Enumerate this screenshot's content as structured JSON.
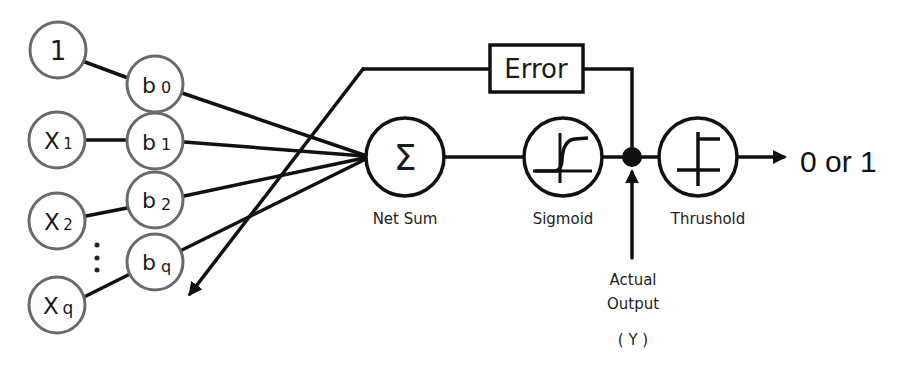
{
  "diagram": {
    "inputs": [
      {
        "label": "1",
        "sub": ""
      },
      {
        "label": "X",
        "sub": "1"
      },
      {
        "label": "X",
        "sub": "2"
      },
      {
        "label": "X",
        "sub": "q"
      }
    ],
    "weights": [
      {
        "label": "b",
        "sub": "0"
      },
      {
        "label": "b",
        "sub": "1"
      },
      {
        "label": "b",
        "sub": "2"
      },
      {
        "label": "b",
        "sub": "q"
      }
    ],
    "ellipsis": "⋮",
    "net_sum": {
      "symbol": "Σ",
      "label": "Net Sum"
    },
    "sigmoid": {
      "label": "Sigmoid"
    },
    "threshold": {
      "label": "Thrushold"
    },
    "error_box": {
      "label": "Error"
    },
    "actual_output": {
      "line1": "Actual",
      "line2": "Output",
      "symbol": "( Y )"
    },
    "output": {
      "label": "0 or 1"
    }
  },
  "colors": {
    "line": "#111111",
    "node_stroke": "#6a6a6a",
    "background": "#ffffff"
  }
}
